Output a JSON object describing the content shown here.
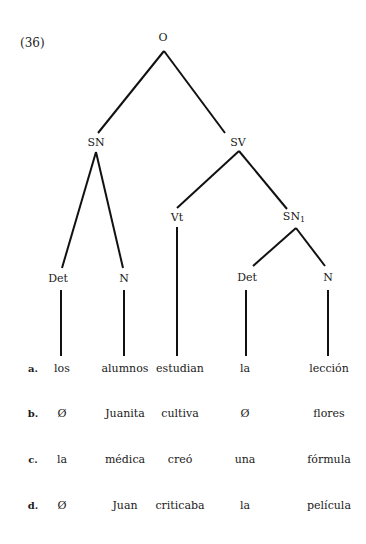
{
  "example_number": "(36)",
  "tree": {
    "nodes": [
      {
        "id": "O",
        "label": "O",
        "x": 163,
        "y": 38
      },
      {
        "id": "SN",
        "label": "SN",
        "x": 96,
        "y": 143
      },
      {
        "id": "SV",
        "label": "SV",
        "x": 238,
        "y": 143
      },
      {
        "id": "Vt",
        "label": "Vt",
        "x": 177,
        "y": 218
      },
      {
        "id": "SN1",
        "label": "SN",
        "sub": "1",
        "x": 294,
        "y": 218
      },
      {
        "id": "Det1",
        "label": "Det",
        "x": 58,
        "y": 279
      },
      {
        "id": "N1",
        "label": "N",
        "x": 124,
        "y": 279
      },
      {
        "id": "Det2",
        "label": "Det",
        "x": 247,
        "y": 278
      },
      {
        "id": "N2",
        "label": "N",
        "x": 328,
        "y": 278
      }
    ],
    "edges": [
      [
        164,
        51,
        98,
        133
      ],
      [
        164,
        51,
        225,
        133
      ],
      [
        96,
        152,
        62,
        268
      ],
      [
        96,
        152,
        123,
        268
      ],
      [
        239,
        151,
        177,
        208
      ],
      [
        239,
        151,
        287,
        209
      ],
      [
        296,
        228,
        253,
        266
      ],
      [
        296,
        228,
        325,
        266
      ],
      [
        61,
        290,
        61,
        356
      ],
      [
        124,
        290,
        124,
        356
      ],
      [
        177,
        227,
        177,
        356
      ],
      [
        246,
        290,
        246,
        356
      ],
      [
        328,
        290,
        328,
        356
      ]
    ]
  },
  "columns_x": [
    62,
    125,
    180,
    245,
    329
  ],
  "rows": [
    {
      "label": "a.",
      "y": 368,
      "words": [
        "los",
        "alumnos",
        "estudian",
        "la",
        "lección"
      ]
    },
    {
      "label": "b.",
      "y": 413,
      "words": [
        "Ø",
        "Juanita",
        "cultiva",
        "Ø",
        "flores"
      ]
    },
    {
      "label": "c.",
      "y": 459,
      "words": [
        "la",
        "médica",
        "creó",
        "una",
        "fórmula"
      ]
    },
    {
      "label": "d.",
      "y": 505,
      "words": [
        "Ø",
        "Juan",
        "criticaba",
        "la",
        "película"
      ]
    }
  ],
  "row_label_x": 33
}
